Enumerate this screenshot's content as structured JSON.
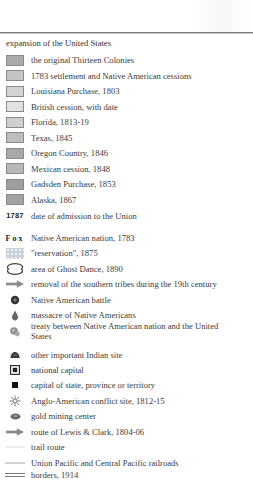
{
  "legend": {
    "heading": "expansion of the United States",
    "expansion_items": [
      {
        "label": "the original Thirteen Colonies",
        "icon": "swatch",
        "color": "#a9a9a9"
      },
      {
        "label": "1783 settlement and Native American cessions",
        "icon": "swatch",
        "color": "#c4c4c4"
      },
      {
        "label": "Louisiana Purchase, 1803",
        "icon": "swatch",
        "color": "#d3d3d3"
      },
      {
        "label": "British cession, with date",
        "icon": "swatch",
        "color": "#e2e2e2"
      },
      {
        "label": "Florida, 1813-19",
        "icon": "swatch",
        "color": "#cfcfcf"
      },
      {
        "label": "Texas, 1845",
        "icon": "swatch",
        "color": "#bdbdbd"
      },
      {
        "label": "Oregon Country, 1846",
        "icon": "swatch",
        "color": "#a8a8a8"
      },
      {
        "label": "Mexican cession, 1848",
        "icon": "swatch",
        "color": "#b8b8b8"
      },
      {
        "label": "Gadsden Purchase, 1853",
        "icon": "swatch",
        "color": "#9f9f9f"
      },
      {
        "label": "Alaska, 1867",
        "icon": "swatch",
        "color": "#a3a3a3"
      }
    ],
    "admission": {
      "tag": "1787",
      "label": "date of admission to the Union"
    },
    "symbols": [
      {
        "tag": "Fox",
        "label": "Native American nation, 1783",
        "icon": "text-tag"
      },
      {
        "label": "\"reservation\", 1875",
        "icon": "dotted-pattern-swatch"
      },
      {
        "label": "area of Ghost Dance, 1890",
        "icon": "outline-blob"
      },
      {
        "label": "removal of the southern tribes during the 19th century",
        "icon": "arrow-right"
      },
      {
        "label": "Native American battle",
        "icon": "battle-dot"
      },
      {
        "label": "massacre of Native Americans",
        "icon": "droplet"
      },
      {
        "label": "treaty between Native American nation and the United States",
        "icon": "treaty-seal"
      },
      {
        "label": "other important Indian site",
        "icon": "mound"
      },
      {
        "label": "national capital",
        "icon": "boxed-square"
      },
      {
        "label": "capital of state, province or territory",
        "icon": "small-square"
      },
      {
        "label": "Anglo-American conflict site, 1812-15",
        "icon": "star-burst"
      },
      {
        "label": "gold mining center",
        "icon": "oval-dot"
      },
      {
        "label": "route of Lewis & Clark, 1804-06",
        "icon": "arrow-right"
      },
      {
        "label": "trail route",
        "icon": "thin-line"
      },
      {
        "label": "Union Pacific and Central Pacific railroads",
        "icon": "line"
      },
      {
        "label": "borders, 1914",
        "icon": "double-line"
      }
    ]
  },
  "colors": {
    "rule": "#7a7a7a",
    "text": "#3a3a3a",
    "symbol_dark": "#444444",
    "arrow": "#8c8c8c"
  }
}
